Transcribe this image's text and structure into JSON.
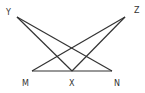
{
  "diagram": {
    "points": {
      "Y": {
        "label": "Y",
        "x": 17,
        "y": 17
      },
      "Z": {
        "label": "Z",
        "x": 125,
        "y": 17
      },
      "M": {
        "label": "M",
        "x": 32,
        "y": 71
      },
      "X": {
        "label": "X",
        "x": 72,
        "y": 71
      },
      "N": {
        "label": "N",
        "x": 112,
        "y": 71
      }
    },
    "segments": [
      [
        "Y",
        "X"
      ],
      [
        "Y",
        "N"
      ],
      [
        "Z",
        "M"
      ],
      [
        "Z",
        "X"
      ],
      [
        "M",
        "N"
      ]
    ],
    "stroke_color": "#333333",
    "background": "#ffffff"
  }
}
